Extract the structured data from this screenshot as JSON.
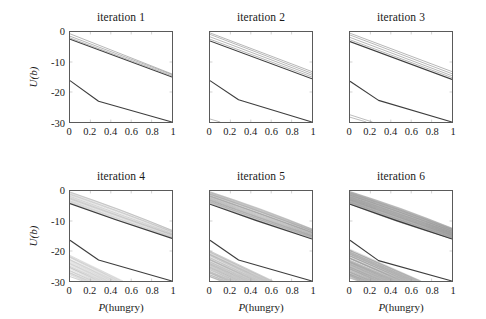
{
  "figure": {
    "axis_label_y": "U(b)",
    "axis_label_x_italic": "P",
    "axis_label_x_rest": "(hungry)",
    "xticks": [
      "0",
      "0.2",
      "0.4",
      "0.6",
      "0.8",
      "1"
    ],
    "yticks": [
      "0",
      "-10",
      "-20",
      "-30"
    ],
    "panel_titles": [
      "iteration 1",
      "iteration 2",
      "iteration 3",
      "iteration 4",
      "iteration 5",
      "iteration 6"
    ]
  },
  "chart_data": {
    "type": "line",
    "title": "",
    "subtitle": "",
    "panel_layout": {
      "rows": 2,
      "cols": 3
    },
    "xlabel": "P(hungry)",
    "ylabel": "U(b)",
    "xlim": [
      0,
      1
    ],
    "ylim": [
      -30,
      0
    ],
    "xticks": [
      0,
      0.2,
      0.4,
      0.6,
      0.8,
      1
    ],
    "yticks": [
      0,
      -10,
      -20,
      -30
    ],
    "grid": false,
    "legend": "none",
    "colors": {
      "dominant_line": "#333333",
      "bundle_line": "#999999",
      "axis": "#5a5a5a",
      "background": "#ffffff"
    },
    "panels": [
      {
        "title": "iteration 1",
        "n_alpha_vectors": 6,
        "series": [
          {
            "name": "upper-dominant",
            "style": "dark",
            "x": [
              0,
              1
            ],
            "values": [
              -2.4,
              -15.0
            ]
          },
          {
            "name": "upper-bundle-1",
            "style": "gray",
            "x": [
              0,
              1
            ],
            "values": [
              -2.0,
              -14.6
            ]
          },
          {
            "name": "upper-bundle-2",
            "style": "gray",
            "x": [
              0,
              1
            ],
            "values": [
              -1.4,
              -14.2
            ]
          },
          {
            "name": "upper-bundle-3",
            "style": "gray",
            "x": [
              0,
              1
            ],
            "values": [
              -0.6,
              -14.0
            ]
          },
          {
            "name": "lower-dominant",
            "style": "dark",
            "x": [
              0,
              0.28,
              1
            ],
            "values": [
              -16.2,
              -23.1,
              -30.0
            ]
          }
        ]
      },
      {
        "title": "iteration 2",
        "n_alpha_vectors": 10,
        "series": [
          {
            "name": "upper-dominant",
            "style": "dark",
            "x": [
              0,
              1
            ],
            "values": [
              -3.0,
              -15.6
            ]
          },
          {
            "name": "upper-bundle-1",
            "style": "gray",
            "x": [
              0,
              1
            ],
            "values": [
              -2.4,
              -15.0
            ]
          },
          {
            "name": "upper-bundle-2",
            "style": "gray",
            "x": [
              0,
              1
            ],
            "values": [
              -1.6,
              -14.4
            ]
          },
          {
            "name": "upper-bundle-3",
            "style": "gray",
            "x": [
              0,
              1
            ],
            "values": [
              -0.8,
              -13.8
            ]
          },
          {
            "name": "upper-bundle-4",
            "style": "gray",
            "x": [
              0,
              1
            ],
            "values": [
              -0.3,
              -13.2
            ]
          },
          {
            "name": "lower-dominant",
            "style": "dark",
            "x": [
              0,
              0.28,
              1
            ],
            "values": [
              -16.2,
              -22.6,
              -30.0
            ]
          },
          {
            "name": "lower-bundle-1",
            "style": "gray",
            "x": [
              0,
              0.1
            ],
            "values": [
              -29.0,
              -30.0
            ]
          }
        ]
      },
      {
        "title": "iteration 3",
        "n_alpha_vectors": 18,
        "series": [
          {
            "name": "upper-dominant",
            "style": "dark",
            "x": [
              0,
              1
            ],
            "values": [
              -3.2,
              -15.8
            ]
          },
          {
            "name": "upper-bundle-1",
            "style": "gray",
            "x": [
              0,
              1
            ],
            "values": [
              -2.6,
              -15.2
            ]
          },
          {
            "name": "upper-bundle-2",
            "style": "gray",
            "x": [
              0,
              1
            ],
            "values": [
              -1.8,
              -14.6
            ]
          },
          {
            "name": "upper-bundle-3",
            "style": "gray",
            "x": [
              0,
              1
            ],
            "values": [
              -1.0,
              -13.9
            ]
          },
          {
            "name": "upper-bundle-4",
            "style": "gray",
            "x": [
              0,
              1
            ],
            "values": [
              -0.4,
              -13.2
            ]
          },
          {
            "name": "lower-dominant",
            "style": "dark",
            "x": [
              0,
              0.28,
              1
            ],
            "values": [
              -16.4,
              -22.8,
              -30.0
            ]
          },
          {
            "name": "lower-bundle-1",
            "style": "gray",
            "x": [
              0,
              0.22
            ],
            "values": [
              -27.6,
              -30.0
            ]
          },
          {
            "name": "lower-bundle-2",
            "style": "gray",
            "x": [
              0,
              0.16
            ],
            "values": [
              -28.4,
              -30.0
            ]
          }
        ]
      },
      {
        "title": "iteration 4",
        "n_alpha_vectors": 40,
        "series": [
          {
            "name": "upper-dominant",
            "style": "dark",
            "x": [
              0,
              0.45,
              1
            ],
            "values": [
              -4.2,
              -9.6,
              -15.8
            ]
          },
          {
            "name": "upper-fan-spread-top",
            "style": "gray",
            "x": [
              0,
              1
            ],
            "values": [
              -0.2,
              -13.0
            ]
          },
          {
            "name": "upper-fan-spread-bottom",
            "style": "gray",
            "x": [
              0,
              1
            ],
            "values": [
              -4.0,
              -15.6
            ]
          },
          {
            "name": "lower-dominant",
            "style": "dark",
            "x": [
              0,
              0.28,
              1
            ],
            "values": [
              -16.4,
              -23.0,
              -30.0
            ]
          },
          {
            "name": "lower-fan-top",
            "style": "gray",
            "x": [
              0,
              0.52
            ],
            "values": [
              -21.4,
              -30.0
            ]
          },
          {
            "name": "lower-fan-bottom",
            "style": "gray",
            "x": [
              0,
              0.12
            ],
            "values": [
              -28.6,
              -30.0
            ]
          }
        ]
      },
      {
        "title": "iteration 5",
        "n_alpha_vectors": 90,
        "series": [
          {
            "name": "upper-dominant",
            "style": "dark",
            "x": [
              0,
              0.45,
              1
            ],
            "values": [
              -4.4,
              -9.8,
              -16.0
            ]
          },
          {
            "name": "upper-fan-spread-top",
            "style": "gray",
            "x": [
              0,
              1
            ],
            "values": [
              -0.2,
              -12.6
            ]
          },
          {
            "name": "upper-fan-spread-bottom",
            "style": "gray",
            "x": [
              0,
              1
            ],
            "values": [
              -4.2,
              -15.8
            ]
          },
          {
            "name": "lower-dominant",
            "style": "dark",
            "x": [
              0,
              0.28,
              1
            ],
            "values": [
              -16.4,
              -23.0,
              -30.0
            ]
          },
          {
            "name": "lower-fan-top",
            "style": "gray",
            "x": [
              0,
              0.62
            ],
            "values": [
              -20.0,
              -30.0
            ]
          },
          {
            "name": "lower-fan-bottom",
            "style": "gray",
            "x": [
              0,
              0.1
            ],
            "values": [
              -28.8,
              -30.0
            ]
          }
        ]
      },
      {
        "title": "iteration 6",
        "n_alpha_vectors": 160,
        "series": [
          {
            "name": "upper-dominant",
            "style": "dark",
            "x": [
              0,
              0.45,
              1
            ],
            "values": [
              -4.4,
              -9.8,
              -16.0
            ]
          },
          {
            "name": "upper-fan-spread-top",
            "style": "gray",
            "x": [
              0,
              1
            ],
            "values": [
              -0.2,
              -12.4
            ]
          },
          {
            "name": "upper-fan-spread-bottom",
            "style": "gray",
            "x": [
              0,
              1
            ],
            "values": [
              -4.4,
              -15.9
            ]
          },
          {
            "name": "lower-dominant",
            "style": "dark",
            "x": [
              0,
              0.28,
              1
            ],
            "values": [
              -16.4,
              -23.2,
              -30.0
            ]
          },
          {
            "name": "lower-fan-top",
            "style": "gray",
            "x": [
              0,
              0.7
            ],
            "values": [
              -19.6,
              -30.0
            ]
          },
          {
            "name": "lower-fan-bottom",
            "style": "gray",
            "x": [
              0,
              0.08
            ],
            "values": [
              -29.0,
              -30.0
            ]
          }
        ]
      }
    ]
  }
}
